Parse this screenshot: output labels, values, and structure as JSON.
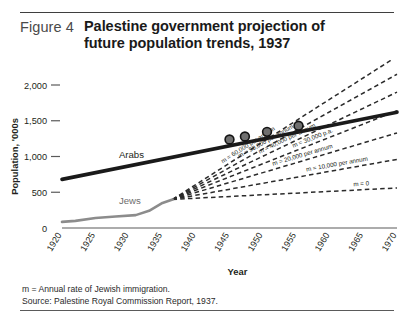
{
  "figure": {
    "number": "Figure 4",
    "title_line1": "Palestine government projection of",
    "title_line2": "future population trends, 1937"
  },
  "footnotes": {
    "note": "m = Annual rate of Jewish immigration.",
    "source": "Source: Palestine Royal Commission Report, 1937."
  },
  "colors": {
    "arabs_line": "#1a1a1a",
    "jews_line": "#8c8c8c",
    "projection_dash": "#2b2b2b",
    "axis": "#5a5a5a",
    "text": "#231f20"
  },
  "chart_data": {
    "type": "line",
    "title": "Palestine government projection of future population trends, 1937",
    "xlabel": "Year",
    "ylabel": "Population, '000s",
    "xlim": [
      1920,
      1970
    ],
    "ylim": [
      0,
      2000
    ],
    "yticks": [
      "0",
      "500",
      "1,000",
      "1,500",
      "2,000"
    ],
    "ytick_values": [
      0,
      500,
      1000,
      1500,
      2000
    ],
    "xticks": [
      "1920",
      "1925",
      "1930",
      "1935",
      "1940",
      "1945",
      "1950",
      "1955",
      "1960",
      "1965",
      "1970"
    ],
    "xtick_values": [
      1920,
      1925,
      1930,
      1935,
      1940,
      1945,
      1950,
      1955,
      1960,
      1965,
      1970
    ],
    "grid": false,
    "legend": "inline-annotations",
    "series": [
      {
        "name": "Arabs",
        "style": "solid-thick",
        "color": "#1a1a1a",
        "x": [
          1920,
          1970
        ],
        "values": [
          680,
          1620
        ]
      },
      {
        "name": "Jews",
        "style": "solid-medium",
        "color": "#8c8c8c",
        "x": [
          1920,
          1922,
          1925,
          1928,
          1931,
          1933,
          1935,
          1936.5
        ],
        "values": [
          85,
          100,
          140,
          160,
          180,
          240,
          350,
          400
        ]
      },
      {
        "name": "m = 60,000 per annum",
        "style": "dashed",
        "color": "#2b2b2b",
        "x": [
          1936.5,
          1970
        ],
        "values": [
          400,
          2400
        ]
      },
      {
        "name": "m = 50,000 per annum",
        "style": "dashed",
        "color": "#2b2b2b",
        "x": [
          1936.5,
          1970
        ],
        "values": [
          400,
          2150
        ]
      },
      {
        "name": "m = 40,000 per annum",
        "style": "dashed",
        "color": "#2b2b2b",
        "x": [
          1936.5,
          1970
        ],
        "values": [
          400,
          1900
        ]
      },
      {
        "name": "m = 30,000 p.a.",
        "style": "dashed",
        "color": "#2b2b2b",
        "x": [
          1936.5,
          1970
        ],
        "values": [
          400,
          1640
        ]
      },
      {
        "name": "m = 20,000 per annum",
        "style": "dashed",
        "color": "#2b2b2b",
        "x": [
          1936.5,
          1970
        ],
        "values": [
          400,
          1330
        ]
      },
      {
        "name": "m = 10,000 per annum",
        "style": "dashed",
        "color": "#2b2b2b",
        "x": [
          1936.5,
          1970
        ],
        "values": [
          400,
          960
        ]
      },
      {
        "name": "m = 0",
        "style": "dashed",
        "color": "#2b2b2b",
        "x": [
          1936.5,
          1970
        ],
        "values": [
          400,
          560
        ]
      }
    ],
    "markers": [
      {
        "label": "crossover-60k",
        "x": 1945.0,
        "y": 1238
      },
      {
        "label": "crossover-50k",
        "x": 1947.3,
        "y": 1280
      },
      {
        "label": "crossover-40k",
        "x": 1950.6,
        "y": 1345
      },
      {
        "label": "crossover-30k",
        "x": 1955.3,
        "y": 1430
      }
    ],
    "annotations": [
      "m = 60,000 per annum",
      "m = 50,000 per annum",
      "m = 40,000 per annum",
      "m = 30,000 p.a.",
      "m = 20,000 per annum",
      "m = 10,000 per annum",
      "m = 0",
      "Arabs",
      "Jews"
    ]
  }
}
